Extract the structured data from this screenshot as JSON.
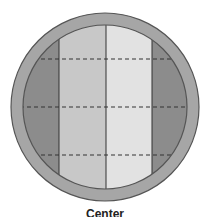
{
  "diagram": {
    "caption": "Center",
    "colors": {
      "rim": "#a6a6a6",
      "rim_stroke": "#555555",
      "outer_zone": "#8c8c8c",
      "inner_left_zone": "#c8c8c8",
      "inner_right_zone": "#e2e2e2",
      "divider": "#333333",
      "dashed_line": "#333333"
    },
    "zones": [
      {
        "name": "left-outer-zone",
        "shade": "outer_zone"
      },
      {
        "name": "left-inner-zone",
        "shade": "inner_left_zone"
      },
      {
        "name": "right-inner-zone",
        "shade": "inner_right_zone"
      },
      {
        "name": "right-outer-zone",
        "shade": "outer_zone"
      }
    ],
    "horizontal_dashed_lines": 3,
    "vertical_dividers": 3
  }
}
